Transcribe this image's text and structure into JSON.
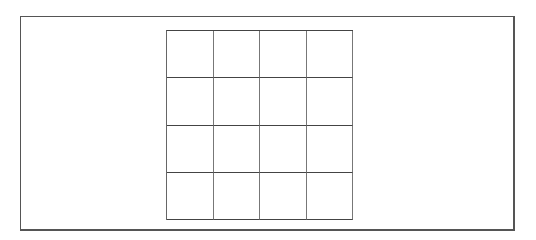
{
  "board": {
    "rows": 4,
    "cols": 4,
    "cells": [
      [
        "",
        "",
        "",
        ""
      ],
      [
        "",
        "",
        "",
        ""
      ],
      [
        "",
        "",
        "",
        ""
      ],
      [
        "",
        "",
        "",
        ""
      ]
    ]
  }
}
